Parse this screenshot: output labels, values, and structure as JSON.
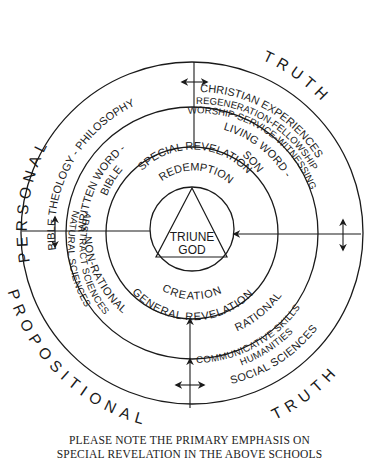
{
  "diagram": {
    "center": {
      "line1": "TRIUNE",
      "line2": "GOD"
    },
    "outer_labels": {
      "top_left": "PERSONAL",
      "top_right": "TRUTH",
      "bottom_left": "PROPOSITIONAL",
      "bottom_right": "TRUTH"
    },
    "ring2": {
      "top_left": "BIBLE THEOLOGY - PHILOSOPHY",
      "top_right_line1": "CHRISTIAN EXPERIENCES",
      "top_right_line2": "REGENERATION-FELLOWSHIP",
      "top_right_line3": "WORSHIP-SERVICE-WITNESSING",
      "bottom_left_line1": "ABSTRACT SCIENCES",
      "bottom_left_line2": "NATURAL SCIENCES",
      "bottom_right_line1": "COMMUNICATIVE SKILLS",
      "bottom_right_line2": "HUMANITIES",
      "bottom_right_line3": "SOCIAL SCIENCES"
    },
    "ring3": {
      "top_left_line1": "WRITTEN WORD -",
      "top_left_line2": "BIBLE",
      "top_right_line1": "LIVING WORD -",
      "top_right_line2": "SON",
      "bottom_left": "NON-RATIONAL",
      "bottom_right": "RATIONAL"
    },
    "ring4": {
      "top_line1": "SPECIAL REVELATION",
      "top_line2": "REDEMPTION",
      "bottom_line1": "CREATION",
      "bottom_line2": "GENERAL REVELATION"
    },
    "note": {
      "line1": "PLEASE NOTE THE PRIMARY EMPHASIS ON",
      "line2": "SPECIAL REVELATION IN THE ABOVE SCHOOLS"
    }
  }
}
